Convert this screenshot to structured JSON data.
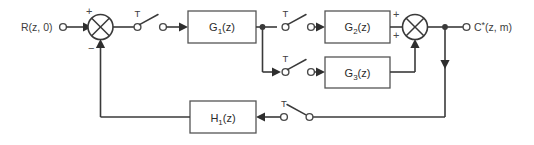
{
  "diagram": {
    "background_color": "#ffffff",
    "line_color": "#3a3a3a",
    "block_stroke_color": "#555555",
    "io": {
      "input_label": "R(z, 0)",
      "output_label_main": "C",
      "output_label_star": "*",
      "output_label_args": "(z, m)"
    },
    "blocks": [
      {
        "id": "g1",
        "label_base": "G",
        "label_sub": "1",
        "label_arg": "(z)"
      },
      {
        "id": "g2",
        "label_base": "G",
        "label_sub": "2",
        "label_arg": "(z)"
      },
      {
        "id": "g3",
        "label_base": "G",
        "label_sub": "3",
        "label_arg": "(z)"
      },
      {
        "id": "h1",
        "label_base": "H",
        "label_sub": "1",
        "label_arg": "(z)"
      }
    ],
    "summers": [
      {
        "id": "summer-input",
        "sign_top": "+",
        "sign_bottom": "−"
      },
      {
        "id": "summer-output",
        "sign_top": "+",
        "sign_bottom": "+"
      }
    ],
    "samplers": [
      {
        "id": "sampler-forward",
        "label": "T"
      },
      {
        "id": "sampler-g2",
        "label": "T"
      },
      {
        "id": "sampler-g3",
        "label": "T"
      },
      {
        "id": "sampler-feedback",
        "label": "T"
      }
    ]
  }
}
